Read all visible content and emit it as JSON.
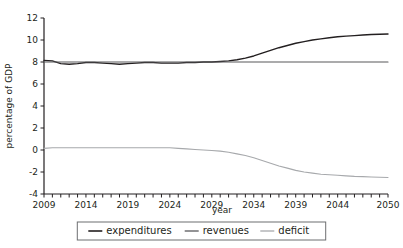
{
  "chart_data": {
    "type": "line",
    "title": "",
    "xlabel": "year",
    "ylabel": "percentage of GDP",
    "xlim": [
      2009,
      2050
    ],
    "ylim": [
      -4,
      12
    ],
    "yticks": [
      -4,
      -2,
      0,
      2,
      4,
      6,
      8,
      10,
      12
    ],
    "ytick_labels": [
      "-4",
      "-2",
      "0",
      "2",
      "4",
      "6",
      "8",
      "10",
      "12"
    ],
    "xticks": [
      2009,
      2014,
      2019,
      2024,
      2029,
      2034,
      2039,
      2044,
      2050
    ],
    "xtick_labels": [
      "2009",
      "2014",
      "2019",
      "2024",
      "2029",
      "2034",
      "2039",
      "2044",
      "2050"
    ],
    "xtick_minor_step": 1,
    "grid": false,
    "legend_position": "bottom",
    "x": [
      2009,
      2010,
      2011,
      2012,
      2013,
      2014,
      2015,
      2016,
      2017,
      2018,
      2019,
      2020,
      2021,
      2022,
      2023,
      2024,
      2025,
      2026,
      2027,
      2028,
      2029,
      2030,
      2031,
      2032,
      2033,
      2034,
      2035,
      2036,
      2037,
      2038,
      2039,
      2040,
      2041,
      2042,
      2043,
      2044,
      2045,
      2046,
      2047,
      2048,
      2049,
      2050
    ],
    "series": [
      {
        "name": "expenditures",
        "color": "#231f20",
        "width": 1.4,
        "values": [
          8.15,
          8.1,
          7.85,
          7.8,
          7.85,
          7.95,
          7.95,
          7.9,
          7.85,
          7.8,
          7.85,
          7.9,
          7.95,
          7.95,
          7.9,
          7.9,
          7.9,
          7.95,
          7.95,
          8.0,
          8.0,
          8.05,
          8.1,
          8.2,
          8.35,
          8.55,
          8.8,
          9.05,
          9.3,
          9.5,
          9.7,
          9.85,
          10.0,
          10.1,
          10.2,
          10.3,
          10.35,
          10.4,
          10.45,
          10.5,
          10.52,
          10.55
        ]
      },
      {
        "name": "revenues",
        "color": "#58595b",
        "width": 1.1,
        "values": [
          8.0,
          8.0,
          8.0,
          8.0,
          8.0,
          8.0,
          8.0,
          8.0,
          8.0,
          8.0,
          8.0,
          8.0,
          8.0,
          8.0,
          8.0,
          8.0,
          8.0,
          8.0,
          8.0,
          8.0,
          8.0,
          8.0,
          8.0,
          8.0,
          8.0,
          8.0,
          8.0,
          8.0,
          8.0,
          8.0,
          8.0,
          8.0,
          8.0,
          8.0,
          8.0,
          8.0,
          8.0,
          8.0,
          8.0,
          8.0,
          8.0,
          8.0
        ]
      },
      {
        "name": "deficit",
        "color": "#a7a9ac",
        "width": 1.1,
        "values": [
          0.15,
          0.2,
          0.2,
          0.2,
          0.2,
          0.2,
          0.2,
          0.2,
          0.2,
          0.2,
          0.2,
          0.2,
          0.2,
          0.2,
          0.2,
          0.2,
          0.15,
          0.1,
          0.05,
          0.0,
          -0.05,
          -0.1,
          -0.2,
          -0.35,
          -0.5,
          -0.7,
          -0.95,
          -1.2,
          -1.45,
          -1.65,
          -1.85,
          -2.0,
          -2.1,
          -2.2,
          -2.25,
          -2.3,
          -2.35,
          -2.4,
          -2.42,
          -2.45,
          -2.48,
          -2.5
        ]
      }
    ],
    "legend": [
      {
        "label": "expenditures",
        "color": "#231f20",
        "width": 1.6
      },
      {
        "label": "revenues",
        "color": "#58595b",
        "width": 1.3
      },
      {
        "label": "deficit",
        "color": "#a7a9ac",
        "width": 1.3
      }
    ]
  },
  "colors": {
    "axis": "#231f20",
    "text": "#231f20",
    "background": "#ffffff",
    "legend_border": "#6d6e71"
  }
}
